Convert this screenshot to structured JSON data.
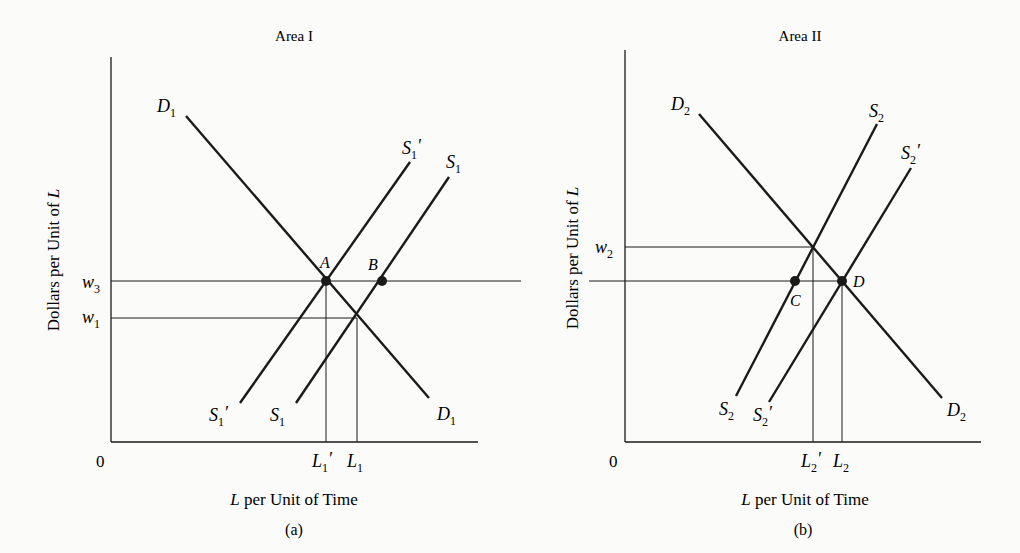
{
  "figure": {
    "panels": [
      {
        "id": "a",
        "title": "Area I",
        "caption": "(a)",
        "origin_label": "0",
        "y_axis_label": {
          "text": "Dollars per Unit of ",
          "var": "L"
        },
        "x_axis_label": {
          "var": "L",
          "text": " per Unit of Time"
        },
        "wage_labels": [
          {
            "base": "w",
            "sub": "3"
          },
          {
            "base": "w",
            "sub": "1"
          }
        ],
        "quantity_labels": [
          {
            "base": "L",
            "sub": "1",
            "prime": "′"
          },
          {
            "base": "L",
            "sub": "1",
            "prime": ""
          }
        ],
        "curves": {
          "demand": {
            "base": "D",
            "sub": "1",
            "prime": ""
          },
          "supply_shifted": {
            "base": "S",
            "sub": "1",
            "prime": "′"
          },
          "supply": {
            "base": "S",
            "sub": "1",
            "prime": ""
          }
        },
        "points": [
          "A",
          "B"
        ]
      },
      {
        "id": "b",
        "title": "Area II",
        "caption": "(b)",
        "origin_label": "0",
        "y_axis_label": {
          "text": "Dollars per Unit of ",
          "var": "L"
        },
        "x_axis_label": {
          "var": "L",
          "text": " per Unit of Time"
        },
        "wage_labels": [
          {
            "base": "w",
            "sub": "2"
          }
        ],
        "quantity_labels": [
          {
            "base": "L",
            "sub": "2",
            "prime": "′"
          },
          {
            "base": "L",
            "sub": "2",
            "prime": ""
          }
        ],
        "curves": {
          "demand": {
            "base": "D",
            "sub": "2",
            "prime": ""
          },
          "supply": {
            "base": "S",
            "sub": "2",
            "prime": ""
          },
          "supply_shifted": {
            "base": "S",
            "sub": "2",
            "prime": "′"
          }
        },
        "points": [
          "C",
          "D"
        ]
      }
    ],
    "colors": {
      "ink": "#1a1a1a",
      "background": "#fbfbfa"
    }
  }
}
